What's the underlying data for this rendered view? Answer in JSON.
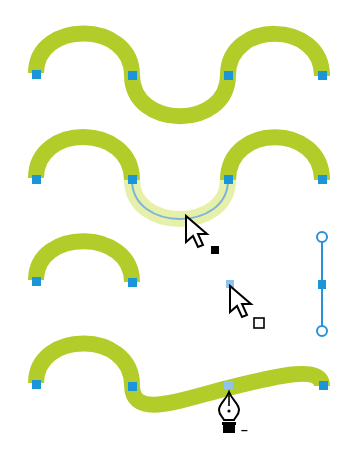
{
  "figure": {
    "colors": {
      "stroke": "#b2cc2a",
      "stroke_selected": "#e6f0a8",
      "anchor": "#1a96d8",
      "anchor_selected": "#8cc4ec",
      "path_line": "#7cb4e0",
      "handle": "#2a90d8",
      "cursor": "#000000",
      "background": "#ffffff"
    },
    "steps": [
      {
        "id": "step-1",
        "label": "Original S-curve path with four anchor points"
      },
      {
        "id": "step-2",
        "label": "Middle segment selected with Direct Selection tool"
      },
      {
        "id": "step-3",
        "label": "Segment deleted; anchor point selected; handle shown"
      },
      {
        "id": "step-4",
        "label": "Delete Anchor Point pen tool removing anchor"
      }
    ],
    "cursors": {
      "direct_selection_filled": "direct-selection-cursor",
      "direct_selection_hollow": "direct-selection-hollow-cursor",
      "pen_minus": "delete-anchor-pen-cursor"
    },
    "pen_minus_label": "–"
  }
}
